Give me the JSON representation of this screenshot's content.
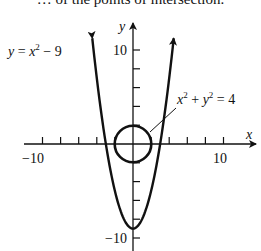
{
  "caption": {
    "text": "… of the points of intersection."
  },
  "chart_data": {
    "type": "line",
    "title": "",
    "xlabel": "x",
    "ylabel": "y",
    "xlim": [
      -11.5,
      13.5
    ],
    "ylim": [
      -11.5,
      12.5
    ],
    "x_tick_step": 2,
    "y_tick_step": 2,
    "x_tick_labels": [
      {
        "value": -10,
        "label": "−10"
      },
      {
        "value": 10,
        "label": "10"
      }
    ],
    "y_tick_labels": [
      {
        "value": 10,
        "label": "10"
      },
      {
        "value": -10,
        "label": "−10"
      }
    ],
    "grid": false,
    "series": [
      {
        "name": "y = x² − 9",
        "kind": "parabola",
        "equation": "y = x^2 - 9",
        "vertex": [
          0,
          -9
        ],
        "x_range": [
          -4.5,
          4.5
        ],
        "arrows": "both-ends"
      },
      {
        "name": "x² + y² = 4",
        "kind": "circle",
        "equation": "x^2 + y^2 = 4",
        "center": [
          0,
          0
        ],
        "radius": 2
      }
    ],
    "annotations": [
      {
        "text_parts": [
          "y",
          " = ",
          "x",
          "2",
          " − 9"
        ],
        "target": "parabola",
        "position": "upper-left"
      },
      {
        "text_parts": [
          "x",
          "2",
          " + ",
          "y",
          "2",
          " = 4"
        ],
        "target": "circle",
        "position": "upper-right",
        "leader_line": true
      }
    ]
  },
  "labels": {
    "x_axis": "x",
    "y_axis": "y",
    "x_min": "−10",
    "x_max": "10",
    "y_max": "10",
    "y_min": "−10",
    "parabola": {
      "var": "y",
      "eq": " = ",
      "x": "x",
      "exp": "2",
      "rest": " − 9"
    },
    "circle": {
      "x": "x",
      "exp1": "2",
      "plus": " + ",
      "y": "y",
      "exp2": "2",
      "rest": " = 4"
    }
  }
}
